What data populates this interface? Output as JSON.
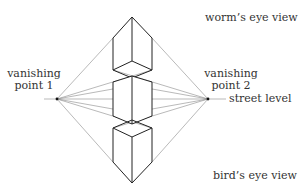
{
  "diagram": {
    "labels": {
      "worms_eye": "worm’s eye view",
      "birds_eye": "bird’s eye view",
      "vp1_line1": "vanishing",
      "vp1_line2": "point 1",
      "vp2_line1": "vanishing",
      "vp2_line2": "point 2",
      "street_level": "street level"
    },
    "colors": {
      "box_stroke": "#222222",
      "guide_stroke": "#888888",
      "text": "#333333"
    },
    "vanishing_points": {
      "vp1": [
        57,
        99
      ],
      "vp2": [
        208,
        99
      ]
    }
  }
}
